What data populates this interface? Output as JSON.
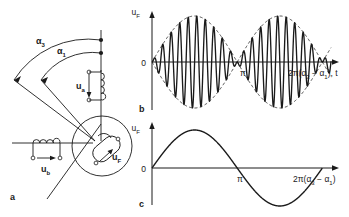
{
  "figure": {
    "panels": [
      {
        "id": "a",
        "label": "a",
        "caption_role": "resolver-schematic"
      },
      {
        "id": "b",
        "label": "b",
        "caption_role": "modulated-carrier-plot"
      },
      {
        "id": "c",
        "label": "c",
        "caption_role": "demodulated-sine-plot"
      }
    ]
  },
  "panel_a": {
    "angle_outer": {
      "symbol": "α",
      "subscript": "3"
    },
    "angle_inner": {
      "symbol": "α",
      "subscript": "1"
    },
    "coil_a": {
      "symbol": "u",
      "subscript": "a"
    },
    "coil_b": {
      "symbol": "u",
      "subscript": "b"
    },
    "coil_f": {
      "symbol": "u",
      "subscript": "F"
    }
  },
  "panel_b": {
    "ylabel": {
      "symbol": "u",
      "subscript": "F"
    },
    "origin_tick": "0",
    "pi_tick": "π",
    "xlabel_prefix": "2π(",
    "xlabel_alpha1": "α",
    "xlabel_sub1": "3",
    "xlabel_minus": " − ",
    "xlabel_alpha2": "α",
    "xlabel_sub2": "1",
    "xlabel_suffix": "), t"
  },
  "panel_c": {
    "ylabel": {
      "symbol": "u",
      "subscript": "F"
    },
    "origin_tick": "0",
    "pi_tick": "π",
    "xlabel_prefix": "2π(",
    "xlabel_alpha1": "α",
    "xlabel_sub1": "3",
    "xlabel_minus": " − ",
    "xlabel_alpha2": "α",
    "xlabel_sub2": "1",
    "xlabel_suffix": ")"
  },
  "colors": {
    "stroke": "#1a1a1a",
    "background": "#ffffff"
  },
  "chart_data": [
    {
      "type": "line",
      "id": "panel_b",
      "title": "",
      "xlabel": "2π(α3 − α1), t",
      "ylabel": "uF",
      "xlim": [
        0,
        6.6
      ],
      "ylim": [
        -1.15,
        1.15
      ],
      "xticks": [
        0,
        3.14159
      ],
      "xticklabels": [
        "0",
        "π"
      ],
      "grid": false,
      "legend": null,
      "series": [
        {
          "name": "carrier",
          "style": "solid",
          "formula": "sin(pi*x/3.14159)*sin(20*x)",
          "description": "high-frequency carrier amplitude-modulated by a full sine period"
        },
        {
          "name": "envelope-upper",
          "style": "dashed",
          "formula": "abs(sin(x))",
          "description": "upper dashed envelope"
        },
        {
          "name": "envelope-lower",
          "style": "dashed",
          "formula": "-abs(sin(x))",
          "description": "lower dashed envelope"
        }
      ],
      "annotations": [
        {
          "text": "π",
          "x": 3.14159,
          "y": -0.12,
          "note": "phase reversal point where envelope pinches to zero"
        }
      ]
    },
    {
      "type": "line",
      "id": "panel_c",
      "title": "",
      "xlabel": "2π(α3 − α1)",
      "ylabel": "uF",
      "xlim": [
        0,
        6.6
      ],
      "ylim": [
        -1.15,
        1.15
      ],
      "xticks": [
        0,
        3.14159
      ],
      "xticklabels": [
        "0",
        "π"
      ],
      "grid": false,
      "legend": null,
      "series": [
        {
          "name": "demodulated",
          "style": "solid",
          "formula": "sin(x)",
          "description": "one full period of a sine wave, positive hump then negative hump"
        }
      ]
    }
  ]
}
